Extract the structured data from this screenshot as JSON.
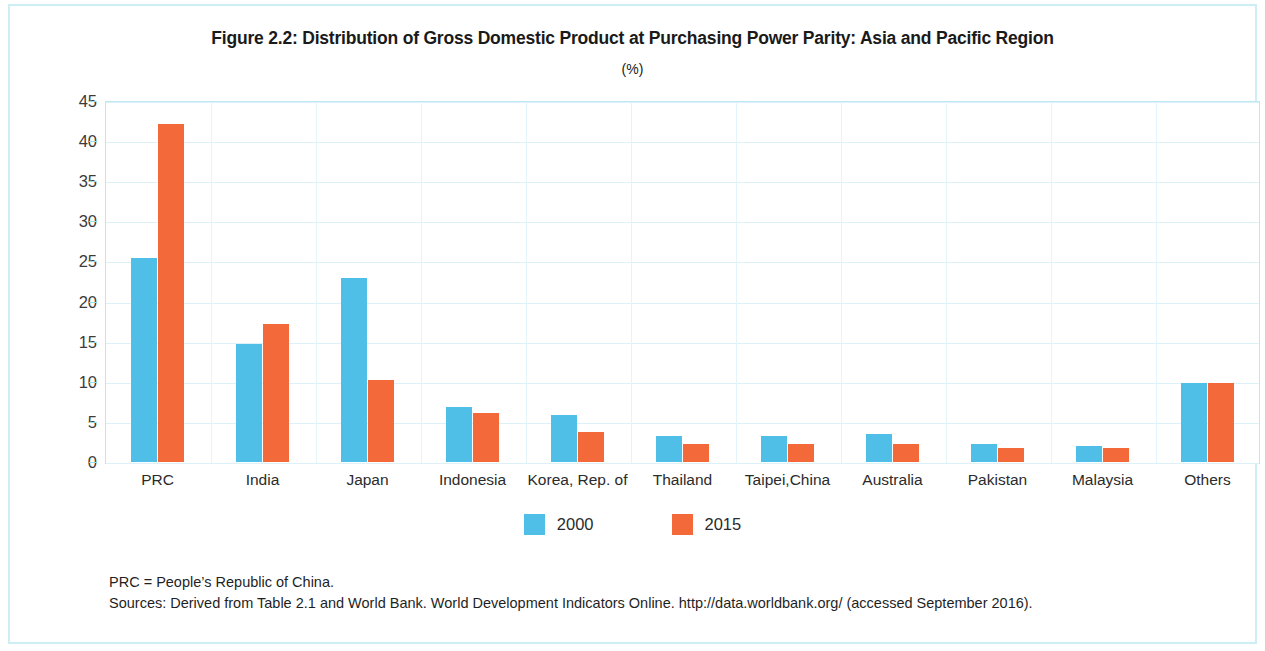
{
  "figure": {
    "title": "Figure 2.2:  Distribution of Gross Domestic Product at Purchasing Power Parity: Asia and Pacific Region",
    "subtitle": "(%)"
  },
  "notes": {
    "abbreviation": "PRC = People’s Republic of China.",
    "sources": "Sources: Derived from Table 2.1 and World Bank. World Development Indicators Online. http://data.worldbank.org/ (accessed September 2016)."
  },
  "colors": {
    "series_2000": "#4fbfe8",
    "series_2015": "#f4693a",
    "frame": "#cdeef5",
    "gridline": "#ddf2f8"
  },
  "chart_data": {
    "type": "bar",
    "title": "Figure 2.2:  Distribution of Gross Domestic Product at Purchasing Power Parity: Asia and Pacific Region",
    "subtitle": "(%)",
    "xlabel": "",
    "ylabel": "",
    "ylim": [
      0,
      45
    ],
    "yticks": [
      0,
      5,
      10,
      15,
      20,
      25,
      30,
      35,
      40,
      45
    ],
    "grid": true,
    "legend_position": "bottom",
    "categories": [
      "PRC",
      "India",
      "Japan",
      "Indonesia",
      "Korea, Rep. of",
      "Thailand",
      "Taipei,China",
      "Australia",
      "Pakistan",
      "Malaysia",
      "Others"
    ],
    "series": [
      {
        "name": "2000",
        "color": "#4fbfe8",
        "values": [
          25.4,
          14.7,
          22.9,
          6.9,
          5.9,
          3.2,
          3.2,
          3.5,
          2.2,
          2.0,
          9.8
        ]
      },
      {
        "name": "2015",
        "color": "#f4693a",
        "values": [
          42.1,
          17.2,
          10.2,
          6.1,
          3.7,
          2.3,
          2.2,
          2.2,
          1.7,
          1.7,
          9.8
        ]
      }
    ]
  }
}
